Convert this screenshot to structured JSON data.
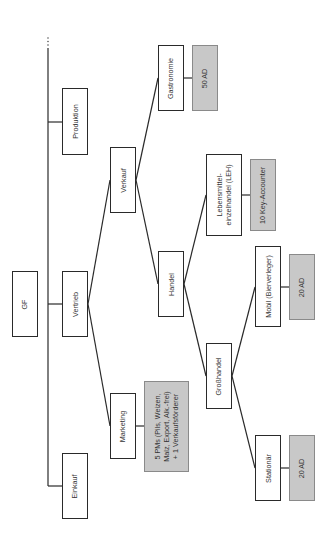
{
  "diagram": {
    "type": "org-chart",
    "orientation": "rotated-90-ccw",
    "ellipsis": "...",
    "nodes": {
      "gf": {
        "label": "GF"
      },
      "produktion": {
        "label": "Produktion"
      },
      "vertrieb": {
        "label": "Vertrieb"
      },
      "einkauf": {
        "label": "Einkauf"
      },
      "verkauf": {
        "label": "Verkauf"
      },
      "marketing": {
        "label": "Marketing"
      },
      "marketing_staff": {
        "label": "5 PMs (Pils, Weizen,\nMalz, Export, Alk.-frei)\n+ 1 Verkaufsförderer"
      },
      "gastronomie": {
        "label": "Gastronomie"
      },
      "gastronomie_staff": {
        "label": "50 AD"
      },
      "handel": {
        "label": "Handel"
      },
      "leh": {
        "label": "Lebensmittel-\neinzelhandel (LEH)"
      },
      "leh_staff": {
        "label": "10 Key-Accounter"
      },
      "grosshandel": {
        "label": "Großhandel"
      },
      "mobil": {
        "label": "Mobil (Bierverleger)"
      },
      "mobil_staff": {
        "label": "20 AD"
      },
      "stationaer": {
        "label": "Stationär"
      },
      "stationaer_staff": {
        "label": "20 AD"
      }
    },
    "edges": [
      [
        "gf",
        "produktion"
      ],
      [
        "gf",
        "vertrieb"
      ],
      [
        "gf",
        "einkauf"
      ],
      [
        "vertrieb",
        "verkauf"
      ],
      [
        "vertrieb",
        "marketing"
      ],
      [
        "marketing",
        "marketing_staff"
      ],
      [
        "verkauf",
        "gastronomie"
      ],
      [
        "verkauf",
        "handel"
      ],
      [
        "gastronomie",
        "gastronomie_staff"
      ],
      [
        "handel",
        "leh"
      ],
      [
        "handel",
        "grosshandel"
      ],
      [
        "leh",
        "leh_staff"
      ],
      [
        "grosshandel",
        "mobil"
      ],
      [
        "grosshandel",
        "stationaer"
      ],
      [
        "mobil",
        "mobil_staff"
      ],
      [
        "stationaer",
        "stationaer_staff"
      ]
    ],
    "colors": {
      "line": "#2a2a2a",
      "box_fill": "#ffffff",
      "staff_fill": "#c8c8c8",
      "staff_border": "#8a8a8a"
    }
  }
}
